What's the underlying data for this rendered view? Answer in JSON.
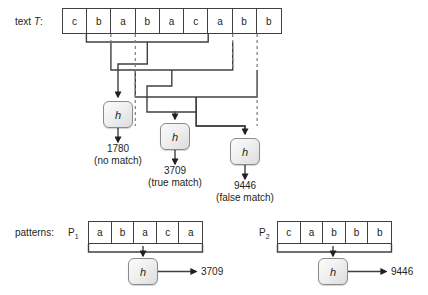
{
  "diagram": {
    "labels": {
      "text_label": "text T:",
      "patterns_label": "patterns:",
      "p1_label": "P",
      "p1_sub": "1",
      "p2_label": "P",
      "p2_sub": "2",
      "hash_fn": "h"
    },
    "text_array": {
      "name": "T",
      "cells": [
        "c",
        "b",
        "a",
        "b",
        "a",
        "c",
        "a",
        "b",
        "b"
      ]
    },
    "windows": [
      {
        "id": "window-1",
        "start_index": 1,
        "length": 5,
        "hash": "1780",
        "note": "(no match)"
      },
      {
        "id": "window-2",
        "start_index": 2,
        "length": 5,
        "hash": "3709",
        "note": "(true match)"
      },
      {
        "id": "window-3",
        "start_index": 3,
        "length": 5,
        "hash": "9446",
        "note": "(false match)"
      }
    ],
    "results": [
      {
        "value": "1780",
        "note": "(no match)"
      },
      {
        "value": "3709",
        "note": "(true match)"
      },
      {
        "value": "9446",
        "note": "(false match)"
      }
    ],
    "patterns": [
      {
        "name": "P1",
        "cells": [
          "a",
          "b",
          "a",
          "c",
          "a"
        ],
        "hash": "3709"
      },
      {
        "name": "P2",
        "cells": [
          "c",
          "a",
          "b",
          "b",
          "b"
        ],
        "hash": "9446"
      }
    ],
    "colors": {
      "line": "#404040",
      "dashed": "#7a7a7a",
      "box_border": "#8a8a8a",
      "box_fill": "#eeeeee",
      "text": "#231f20",
      "background": "#ffffff"
    }
  }
}
